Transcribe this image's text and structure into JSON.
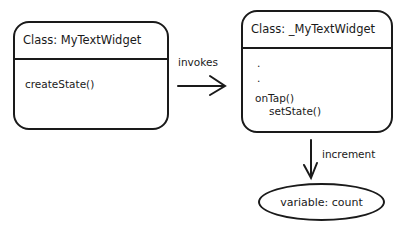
{
  "diagram": {
    "left_class": {
      "title": "Class: MyTextWidget",
      "methods": [
        "createState()"
      ]
    },
    "right_class": {
      "title": "Class: _MyTextWidget",
      "lines": [
        ".",
        ".",
        "onTap()",
        "setState()"
      ]
    },
    "edges": {
      "invokes": "invokes",
      "increment": "increment"
    },
    "variable": {
      "label": "variable: count"
    },
    "colors": {
      "stroke": "#1a1a1a",
      "background": "#ffffff"
    }
  }
}
